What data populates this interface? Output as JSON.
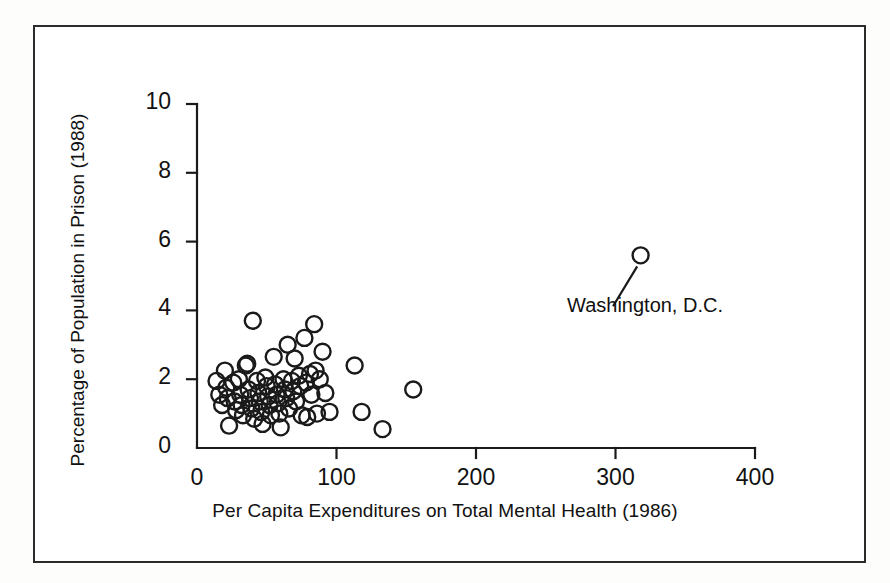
{
  "figure": {
    "background_color": "#ffffff",
    "frame_color": "#2b2b2b",
    "marker_color": "#1a1a1a"
  },
  "chart_data": {
    "type": "scatter",
    "title": "",
    "xlabel": "Per Capita Expenditures on Total Mental Health (1986)",
    "ylabel": "Percentage of Population in Prison (1988)",
    "xlim": [
      0,
      400
    ],
    "ylim": [
      0,
      10
    ],
    "xticks": [
      0,
      100,
      200,
      300,
      400
    ],
    "xticklabels": [
      "0",
      "100",
      "200",
      "300",
      "400"
    ],
    "yticks": [
      0,
      2,
      4,
      6,
      8,
      10
    ],
    "yticklabels": [
      "0",
      "2",
      "4",
      "6",
      "8",
      "10"
    ],
    "grid": false,
    "legend": null,
    "marker": "open-circle",
    "annotations": [
      {
        "text": "Washington, D.C.",
        "label_x": 265,
        "label_y": 4.35,
        "point_x": 318,
        "point_y": 5.6
      }
    ],
    "points": [
      {
        "x": 14,
        "y": 1.95
      },
      {
        "x": 16,
        "y": 1.55
      },
      {
        "x": 18,
        "y": 1.25
      },
      {
        "x": 20,
        "y": 2.25
      },
      {
        "x": 21,
        "y": 1.75
      },
      {
        "x": 22,
        "y": 1.45
      },
      {
        "x": 23,
        "y": 0.65
      },
      {
        "x": 26,
        "y": 1.9
      },
      {
        "x": 27,
        "y": 1.35
      },
      {
        "x": 28,
        "y": 1.1
      },
      {
        "x": 30,
        "y": 2.0
      },
      {
        "x": 31,
        "y": 1.55
      },
      {
        "x": 32,
        "y": 1.25
      },
      {
        "x": 33,
        "y": 0.95
      },
      {
        "x": 35,
        "y": 2.4
      },
      {
        "x": 36,
        "y": 2.45
      },
      {
        "x": 37,
        "y": 1.7
      },
      {
        "x": 38,
        "y": 1.45
      },
      {
        "x": 39,
        "y": 1.15
      },
      {
        "x": 40,
        "y": 3.7
      },
      {
        "x": 41,
        "y": 0.85
      },
      {
        "x": 43,
        "y": 1.95
      },
      {
        "x": 44,
        "y": 1.6
      },
      {
        "x": 45,
        "y": 1.35
      },
      {
        "x": 46,
        "y": 1.05
      },
      {
        "x": 47,
        "y": 0.7
      },
      {
        "x": 49,
        "y": 2.05
      },
      {
        "x": 50,
        "y": 1.8
      },
      {
        "x": 51,
        "y": 1.5
      },
      {
        "x": 52,
        "y": 1.25
      },
      {
        "x": 53,
        "y": 0.95
      },
      {
        "x": 55,
        "y": 2.65
      },
      {
        "x": 56,
        "y": 1.85
      },
      {
        "x": 57,
        "y": 1.55
      },
      {
        "x": 58,
        "y": 1.3
      },
      {
        "x": 59,
        "y": 1.0
      },
      {
        "x": 60,
        "y": 0.6
      },
      {
        "x": 62,
        "y": 2.0
      },
      {
        "x": 63,
        "y": 1.7
      },
      {
        "x": 64,
        "y": 1.45
      },
      {
        "x": 65,
        "y": 3.0
      },
      {
        "x": 66,
        "y": 1.15
      },
      {
        "x": 68,
        "y": 1.95
      },
      {
        "x": 69,
        "y": 1.65
      },
      {
        "x": 70,
        "y": 2.6
      },
      {
        "x": 71,
        "y": 1.35
      },
      {
        "x": 73,
        "y": 2.1
      },
      {
        "x": 74,
        "y": 1.8
      },
      {
        "x": 75,
        "y": 0.95
      },
      {
        "x": 77,
        "y": 3.2
      },
      {
        "x": 78,
        "y": 1.9
      },
      {
        "x": 79,
        "y": 0.9
      },
      {
        "x": 81,
        "y": 2.15
      },
      {
        "x": 82,
        "y": 1.55
      },
      {
        "x": 84,
        "y": 3.6
      },
      {
        "x": 85,
        "y": 2.25
      },
      {
        "x": 86,
        "y": 1.0
      },
      {
        "x": 88,
        "y": 2.0
      },
      {
        "x": 90,
        "y": 2.8
      },
      {
        "x": 92,
        "y": 1.6
      },
      {
        "x": 95,
        "y": 1.05
      },
      {
        "x": 113,
        "y": 2.4
      },
      {
        "x": 118,
        "y": 1.05
      },
      {
        "x": 133,
        "y": 0.55
      },
      {
        "x": 155,
        "y": 1.7
      },
      {
        "x": 318,
        "y": 5.6
      }
    ]
  }
}
